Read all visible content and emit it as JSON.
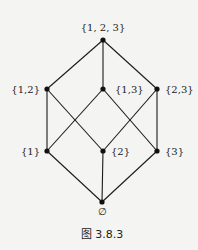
{
  "diagram": {
    "type": "hasse-diagram",
    "nodes": [
      {
        "id": "top",
        "label": "{1, 2, 3}",
        "x": 103,
        "y": 40,
        "lx": 103,
        "ly": 31,
        "anchor": "middle"
      },
      {
        "id": "s12",
        "label": "{1,2}",
        "x": 47,
        "y": 89,
        "lx": 40,
        "ly": 93,
        "anchor": "end"
      },
      {
        "id": "s13",
        "label": "{1,3}",
        "x": 103,
        "y": 89,
        "lx": 115,
        "ly": 93,
        "anchor": "start"
      },
      {
        "id": "s23",
        "label": "{2,3}",
        "x": 157,
        "y": 89,
        "lx": 165,
        "ly": 93,
        "anchor": "start"
      },
      {
        "id": "s1",
        "label": "{1}",
        "x": 47,
        "y": 151,
        "lx": 40,
        "ly": 155,
        "anchor": "end"
      },
      {
        "id": "s2",
        "label": "{2}",
        "x": 103,
        "y": 151,
        "lx": 111,
        "ly": 155,
        "anchor": "start"
      },
      {
        "id": "s3",
        "label": "{3}",
        "x": 157,
        "y": 151,
        "lx": 165,
        "ly": 155,
        "anchor": "start"
      },
      {
        "id": "empty",
        "label": "∅",
        "x": 102,
        "y": 202,
        "lx": 102,
        "ly": 215,
        "anchor": "middle"
      }
    ],
    "edges": [
      [
        "top",
        "s12"
      ],
      [
        "top",
        "s13"
      ],
      [
        "top",
        "s23"
      ],
      [
        "s12",
        "s1"
      ],
      [
        "s12",
        "s2"
      ],
      [
        "s13",
        "s1"
      ],
      [
        "s13",
        "s3"
      ],
      [
        "s23",
        "s2"
      ],
      [
        "s23",
        "s3"
      ],
      [
        "s1",
        "empty"
      ],
      [
        "s2",
        "empty"
      ],
      [
        "s3",
        "empty"
      ]
    ],
    "caption": "图 3.8.3",
    "colors": {
      "line": "#1a1a1a",
      "node": "#111111",
      "text": "#222222",
      "background": "#f4f4f2"
    }
  }
}
